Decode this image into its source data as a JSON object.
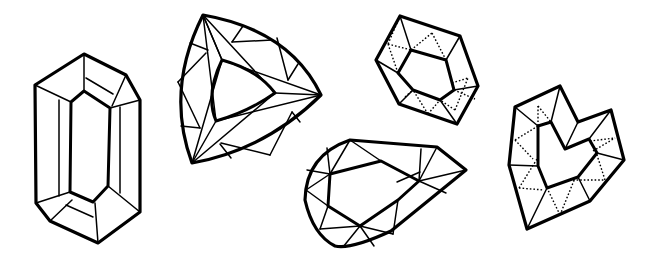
{
  "illustration": {
    "title": "Gemstone cuts line drawing",
    "background_color": "#ffffff",
    "line_color": "#000000",
    "gems": [
      {
        "id": "emerald-cut",
        "label": "Emerald cut gem",
        "facet_style": "solid"
      },
      {
        "id": "trillion-cut",
        "label": "Trillion cut gem",
        "facet_style": "solid"
      },
      {
        "id": "hexagon-cut",
        "label": "Hexagon cut gem",
        "facet_style": "dotted"
      },
      {
        "id": "pear-cut",
        "label": "Pear cut gem",
        "facet_style": "solid"
      },
      {
        "id": "heart-cut",
        "label": "Heart cut gem",
        "facet_style": "dotted"
      }
    ]
  }
}
